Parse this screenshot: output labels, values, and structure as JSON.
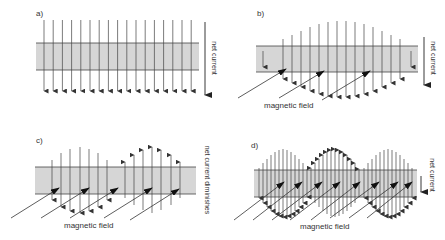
{
  "colors": {
    "band_fill": "#d6d6d6",
    "band_edge": "#444444",
    "arrow": "#444444",
    "field": "#333333",
    "background": "#ffffff"
  },
  "panels": [
    {
      "id": "a",
      "letter": "a)",
      "letter_pos": [
        36,
        16
      ],
      "band": {
        "x": 36,
        "y": 43,
        "w": 163,
        "h": 27
      },
      "side_label": "net current",
      "side_label_pos": [
        212,
        58
      ],
      "net_arrow": {
        "x": 205,
        "y1": 22,
        "y2": 95,
        "dir": "down"
      },
      "vectors": {
        "mode": "uniform",
        "x_start": 44,
        "x_step": 9.2,
        "count": 17,
        "y_top": 20,
        "y_bottom": 91,
        "dir": "down"
      },
      "field_arrows": [],
      "field_label": ""
    },
    {
      "id": "b",
      "letter": "b)",
      "letter_pos": [
        257,
        16
      ],
      "band": {
        "x": 256,
        "y": 46,
        "w": 162,
        "h": 26
      },
      "side_label": "net current",
      "side_label_pos": [
        431,
        58
      ],
      "net_arrow": {
        "x": 424,
        "y1": 37,
        "y2": 85,
        "dir": "down"
      },
      "vectors": {
        "mode": "envelope",
        "center_y": 59,
        "columns": [
          {
            "x": 263,
            "half": 8,
            "dir": "down"
          },
          {
            "x": 283,
            "half": 20,
            "dir": "down"
          },
          {
            "x": 292,
            "half": 24,
            "dir": "down"
          },
          {
            "x": 301,
            "half": 28,
            "dir": "down"
          },
          {
            "x": 310,
            "half": 32,
            "dir": "down"
          },
          {
            "x": 319,
            "half": 35,
            "dir": "down"
          },
          {
            "x": 328,
            "half": 37,
            "dir": "down"
          },
          {
            "x": 337,
            "half": 38,
            "dir": "down"
          },
          {
            "x": 346,
            "half": 38,
            "dir": "down"
          },
          {
            "x": 355,
            "half": 37,
            "dir": "down"
          },
          {
            "x": 364,
            "half": 35,
            "dir": "down"
          },
          {
            "x": 373,
            "half": 32,
            "dir": "down"
          },
          {
            "x": 382,
            "half": 28,
            "dir": "down"
          },
          {
            "x": 391,
            "half": 24,
            "dir": "down"
          },
          {
            "x": 400,
            "half": 20,
            "dir": "down"
          },
          {
            "x": 411,
            "half": 8,
            "dir": "down"
          }
        ]
      },
      "field_arrows": [
        {
          "x1": 238,
          "y1": 98,
          "x2": 286,
          "y2": 69
        },
        {
          "x1": 279,
          "y1": 98,
          "x2": 324,
          "y2": 71
        },
        {
          "x1": 322,
          "y1": 100,
          "x2": 370,
          "y2": 71
        }
      ],
      "field_label": "magnetic field",
      "field_label_pos": [
        264,
        108
      ]
    },
    {
      "id": "c",
      "letter": "c)",
      "letter_pos": [
        36,
        143
      ],
      "band": {
        "x": 35,
        "y": 167,
        "w": 161,
        "h": 27
      },
      "side_label": "net current diminishes",
      "side_label_pos": [
        205,
        180
      ],
      "net_arrow": null,
      "vectors": {
        "mode": "envelope",
        "center_y": 180,
        "columns": [
          {
            "x": 52,
            "half": 20,
            "dir": "down"
          },
          {
            "x": 61,
            "half": 27,
            "dir": "down"
          },
          {
            "x": 70,
            "half": 31,
            "dir": "down"
          },
          {
            "x": 80,
            "half": 33,
            "dir": "down"
          },
          {
            "x": 89,
            "half": 31,
            "dir": "down"
          },
          {
            "x": 98,
            "half": 27,
            "dir": "down"
          },
          {
            "x": 107,
            "half": 20,
            "dir": "down"
          },
          {
            "x": 125,
            "half": 18,
            "dir": "up"
          },
          {
            "x": 134,
            "half": 25,
            "dir": "up"
          },
          {
            "x": 143,
            "half": 30,
            "dir": "up"
          },
          {
            "x": 152,
            "half": 33,
            "dir": "up"
          },
          {
            "x": 161,
            "half": 30,
            "dir": "up"
          },
          {
            "x": 171,
            "half": 25,
            "dir": "up"
          },
          {
            "x": 180,
            "half": 18,
            "dir": "up"
          }
        ]
      },
      "field_arrows": [
        {
          "x1": 11,
          "y1": 218,
          "x2": 59,
          "y2": 188
        },
        {
          "x1": 41,
          "y1": 218,
          "x2": 89,
          "y2": 188
        },
        {
          "x1": 70,
          "y1": 218,
          "x2": 118,
          "y2": 188
        },
        {
          "x1": 104,
          "y1": 218,
          "x2": 152,
          "y2": 188
        },
        {
          "x1": 130,
          "y1": 220,
          "x2": 179,
          "y2": 189
        }
      ],
      "field_label": "magnetic field",
      "field_label_pos": [
        64,
        228
      ]
    },
    {
      "id": "d",
      "letter": "d)",
      "letter_pos": [
        251,
        148
      ],
      "band": {
        "x": 254,
        "y": 170,
        "w": 163,
        "h": 27
      },
      "side_label": "net current",
      "side_label_pos": [
        430,
        175
      ],
      "net_arrow": {
        "x": 421,
        "y1": 176,
        "y2": 192,
        "dir": "down"
      },
      "vectors": {
        "mode": "envelope",
        "center_y": 183,
        "columns": [
          {
            "x": 259,
            "half": 15,
            "dir": "down"
          },
          {
            "x": 263,
            "half": 20,
            "dir": "down"
          },
          {
            "x": 267,
            "half": 24,
            "dir": "down"
          },
          {
            "x": 271,
            "half": 28,
            "dir": "down"
          },
          {
            "x": 275,
            "half": 31,
            "dir": "down"
          },
          {
            "x": 279,
            "half": 33,
            "dir": "down"
          },
          {
            "x": 283,
            "half": 34,
            "dir": "down"
          },
          {
            "x": 287,
            "half": 33,
            "dir": "down"
          },
          {
            "x": 291,
            "half": 31,
            "dir": "down"
          },
          {
            "x": 295,
            "half": 28,
            "dir": "down"
          },
          {
            "x": 299,
            "half": 24,
            "dir": "down"
          },
          {
            "x": 303,
            "half": 20,
            "dir": "down"
          },
          {
            "x": 307,
            "half": 14,
            "dir": "down"
          },
          {
            "x": 311,
            "half": 15,
            "dir": "up"
          },
          {
            "x": 315,
            "half": 20,
            "dir": "up"
          },
          {
            "x": 319,
            "half": 24,
            "dir": "up"
          },
          {
            "x": 323,
            "half": 28,
            "dir": "up"
          },
          {
            "x": 327,
            "half": 31,
            "dir": "up"
          },
          {
            "x": 331,
            "half": 33,
            "dir": "up"
          },
          {
            "x": 335,
            "half": 34,
            "dir": "up"
          },
          {
            "x": 339,
            "half": 33,
            "dir": "up"
          },
          {
            "x": 343,
            "half": 31,
            "dir": "up"
          },
          {
            "x": 347,
            "half": 28,
            "dir": "up"
          },
          {
            "x": 351,
            "half": 24,
            "dir": "up"
          },
          {
            "x": 355,
            "half": 20,
            "dir": "up"
          },
          {
            "x": 359,
            "half": 14,
            "dir": "up"
          },
          {
            "x": 364,
            "half": 15,
            "dir": "down"
          },
          {
            "x": 368,
            "half": 20,
            "dir": "down"
          },
          {
            "x": 372,
            "half": 24,
            "dir": "down"
          },
          {
            "x": 376,
            "half": 28,
            "dir": "down"
          },
          {
            "x": 380,
            "half": 31,
            "dir": "down"
          },
          {
            "x": 384,
            "half": 33,
            "dir": "down"
          },
          {
            "x": 388,
            "half": 34,
            "dir": "down"
          },
          {
            "x": 392,
            "half": 33,
            "dir": "down"
          },
          {
            "x": 396,
            "half": 31,
            "dir": "down"
          },
          {
            "x": 400,
            "half": 28,
            "dir": "down"
          },
          {
            "x": 404,
            "half": 24,
            "dir": "down"
          },
          {
            "x": 408,
            "half": 20,
            "dir": "down"
          },
          {
            "x": 412,
            "half": 15,
            "dir": "down"
          }
        ]
      },
      "field_arrows": [
        {
          "x1": 234,
          "y1": 220,
          "x2": 284,
          "y2": 182
        },
        {
          "x1": 253,
          "y1": 220,
          "x2": 302,
          "y2": 182
        },
        {
          "x1": 272,
          "y1": 220,
          "x2": 322,
          "y2": 182
        },
        {
          "x1": 290,
          "y1": 220,
          "x2": 340,
          "y2": 182
        },
        {
          "x1": 311,
          "y1": 220,
          "x2": 360,
          "y2": 182
        },
        {
          "x1": 330,
          "y1": 218,
          "x2": 379,
          "y2": 182
        },
        {
          "x1": 349,
          "y1": 218,
          "x2": 398,
          "y2": 182
        },
        {
          "x1": 367,
          "y1": 218,
          "x2": 412,
          "y2": 182
        }
      ],
      "field_label": "magnetic field",
      "field_label_pos": [
        300,
        229
      ]
    }
  ]
}
